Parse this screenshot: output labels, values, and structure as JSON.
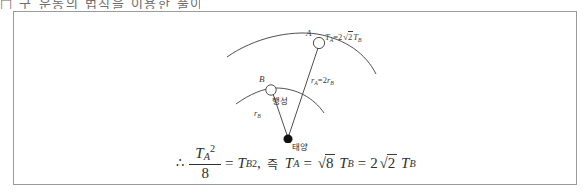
{
  "clipped_header": {
    "text": "□ 구 운동의 법칙을 이용한 풀이"
  },
  "figure": {
    "diagram": {
      "point_a_label": "A",
      "point_b_label": "B",
      "period_relation": {
        "lhs": "T",
        "lhs_sub": "A",
        "equals": "=",
        "coefficient": "2",
        "radical_symbol": "√",
        "radicand": "2",
        "rhs": "T",
        "rhs_sub": "B",
        "full_text": "T_A = 2√2 T_B"
      },
      "radius_relation": {
        "lhs": "r",
        "lhs_sub": "A",
        "equals": "=",
        "coefficient": "2",
        "rhs": "r",
        "rhs_sub": "B",
        "full_text": "r_A = 2r_B"
      },
      "radius_b_label": {
        "symbol": "r",
        "subscript": "B",
        "full_text": "r_B"
      },
      "planet_label": "행성",
      "sun_label": "태양",
      "orbit_a_name": "orbit-arc-a",
      "orbit_b_name": "orbit-arc-b",
      "colors": {
        "stroke": "#3b3b3b",
        "sun_fill": "#111111",
        "planet_fill": "#ffffff",
        "panel_border": "#9a9a9a"
      }
    },
    "equation": {
      "therefore": "∴",
      "numerator": "T",
      "numerator_sub": "A",
      "numerator_sup": "2",
      "denominator": "8",
      "equals_1": "=",
      "tb": "T",
      "tb_sub": "B",
      "tb_sup": "2",
      "comma": ",",
      "then_word": "즉",
      "ta": "T",
      "ta_sub": "A",
      "equals_2": "=",
      "radical_symbol": "√",
      "radicand_1": "8",
      "tb2": "T",
      "tb2_sub": "B",
      "equals_3": "=",
      "coefficient": "2",
      "radicand_2": "2",
      "tb3": "T",
      "tb3_sub": "B",
      "full_text": "∴ T_A²/8 = T_B², 즉 T_A = √8 T_B = 2√2 T_B"
    }
  }
}
